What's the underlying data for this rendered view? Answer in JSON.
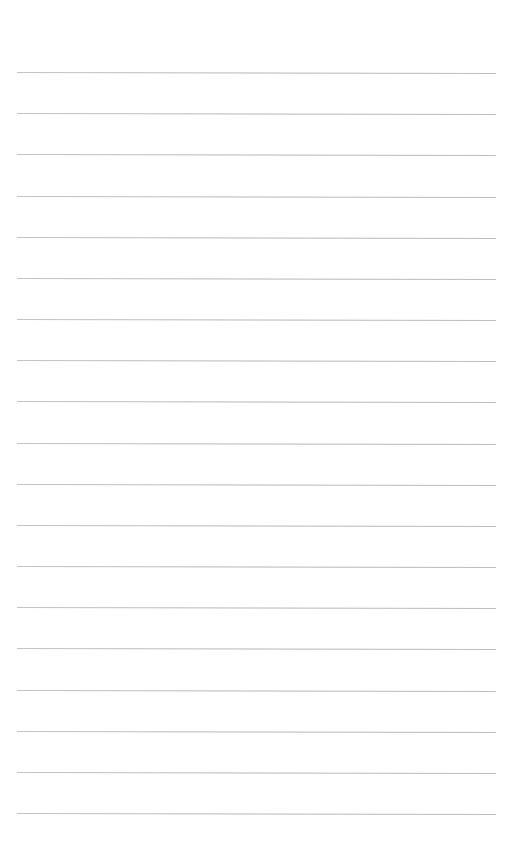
{
  "page": {
    "type": "lined-paper",
    "background_color": "#ffffff",
    "line_color": "#b9b9b9",
    "line_count": 19,
    "line_left": 17,
    "line_right": 496,
    "line_thickness": 1,
    "line_positions_y": [
      72,
      113,
      154,
      196,
      237,
      278,
      319,
      360,
      401,
      443,
      484,
      525,
      566,
      607,
      648,
      690,
      731,
      772,
      813
    ]
  }
}
